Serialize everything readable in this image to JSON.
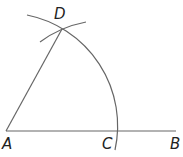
{
  "diagram": {
    "points": {
      "A": {
        "label": "A",
        "x": 6,
        "y": 131
      },
      "B": {
        "label": "B",
        "x": 176,
        "y": 131
      },
      "C": {
        "label": "C",
        "x": 118,
        "y": 131
      },
      "D": {
        "label": "D",
        "x": 62,
        "y": 29
      }
    },
    "segments": [
      [
        "A",
        "B"
      ],
      [
        "A",
        "D"
      ]
    ],
    "arcs": [
      {
        "center": "A",
        "through": "C",
        "description": "large arc centered at A through C and D"
      },
      {
        "center": "C",
        "through": "D",
        "description": "small arc centered at C intersecting at D"
      }
    ],
    "stroke_color": "#666666"
  }
}
